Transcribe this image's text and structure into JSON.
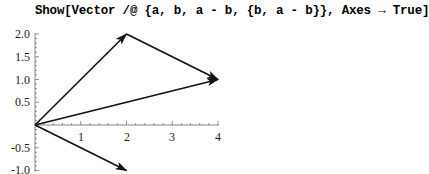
{
  "notebook": {
    "input_cell": "Show[Vector /@ {a, b, a - b, {b, a - b}}, Axes → True]"
  },
  "chart_data": {
    "type": "vector-plot",
    "title": "",
    "xlabel": "",
    "ylabel": "",
    "axes": true,
    "xlim": [
      0,
      4
    ],
    "ylim": [
      -1.0,
      2.0
    ],
    "x_ticks": [
      "1",
      "2",
      "3",
      "4"
    ],
    "y_ticks": [
      "2.0",
      "1.5",
      "1.0",
      "0.5",
      "-0.5",
      "-1.0"
    ],
    "vectors": [
      {
        "name": "a",
        "from": [
          0,
          0
        ],
        "to": [
          2,
          2
        ]
      },
      {
        "name": "b",
        "from": [
          0,
          0
        ],
        "to": [
          4,
          1
        ]
      },
      {
        "name": "a - b",
        "from": [
          0,
          0
        ],
        "to": [
          2,
          -1
        ]
      },
      {
        "name": "a - b at b",
        "from": [
          2,
          2
        ],
        "to": [
          4,
          1
        ]
      }
    ]
  }
}
